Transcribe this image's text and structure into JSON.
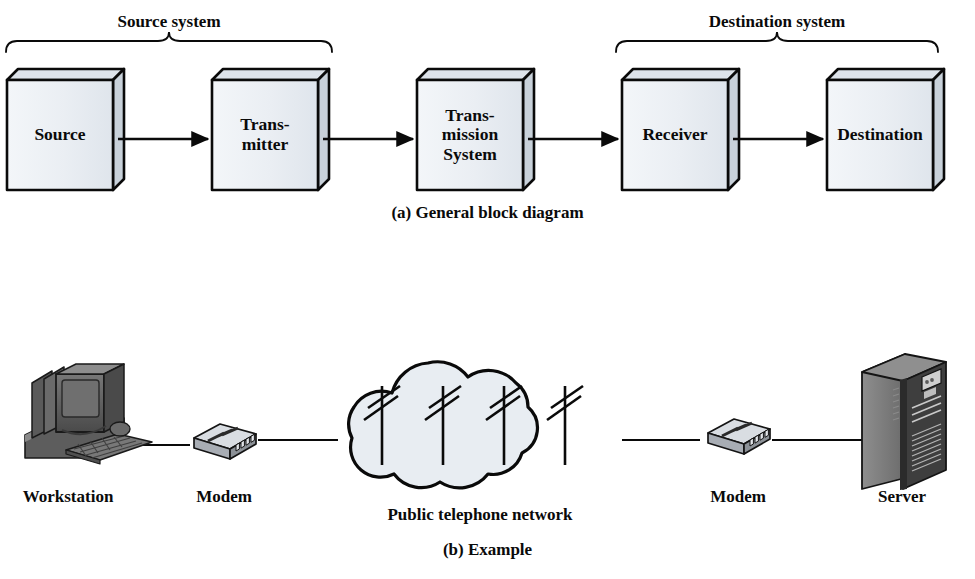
{
  "figure": {
    "panel_a": {
      "caption": "(a) General block diagram",
      "brackets": [
        {
          "label": "Source system",
          "x1": 6,
          "x2": 332,
          "cx": 169
        },
        {
          "label": "Destination system",
          "x1": 616,
          "x2": 938,
          "cx": 777
        }
      ],
      "blocks": [
        {
          "name": "source",
          "lines": [
            "Source"
          ],
          "x": 7,
          "y": 80,
          "w": 106,
          "h": 110
        },
        {
          "name": "transmitter",
          "lines": [
            "Trans-",
            "mitter"
          ],
          "x": 212,
          "y": 80,
          "w": 106,
          "h": 110
        },
        {
          "name": "transmission-system",
          "lines": [
            "Trans-",
            "mission",
            "System"
          ],
          "x": 417,
          "y": 80,
          "w": 106,
          "h": 110
        },
        {
          "name": "receiver",
          "lines": [
            "Receiver"
          ],
          "x": 622,
          "y": 80,
          "w": 106,
          "h": 110
        },
        {
          "name": "destination",
          "lines": [
            "Destination"
          ],
          "x": 827,
          "y": 80,
          "w": 106,
          "h": 110
        }
      ],
      "arrows": [
        {
          "from": "source",
          "to": "transmitter",
          "x1": 118,
          "x2": 208,
          "y": 139
        },
        {
          "from": "transmitter",
          "to": "transmission-system",
          "x1": 323,
          "x2": 413,
          "y": 139
        },
        {
          "from": "transmission-system",
          "to": "receiver",
          "x1": 528,
          "x2": 618,
          "y": 139
        },
        {
          "from": "receiver",
          "to": "destination",
          "x1": 733,
          "x2": 823,
          "y": 139
        }
      ]
    },
    "panel_b": {
      "caption": "(b) Example",
      "nodes": [
        {
          "name": "workstation",
          "icon": "workstation-icon",
          "label": "Workstation",
          "label_cx": 68,
          "label_y": 487
        },
        {
          "name": "modem-left",
          "icon": "modem-icon",
          "label": "Modem",
          "label_cx": 224,
          "label_y": 487
        },
        {
          "name": "public-telephone-network",
          "icon": "cloud-icon",
          "label": "Public telephone network",
          "label_cx": 480,
          "label_y": 505
        },
        {
          "name": "modem-right",
          "icon": "modem-icon",
          "label": "Modem",
          "label_cx": 738,
          "label_y": 487
        },
        {
          "name": "server",
          "icon": "server-icon",
          "label": "Server",
          "label_cx": 902,
          "label_y": 487
        }
      ],
      "links": [
        {
          "from": "workstation",
          "to": "modem-left",
          "x1": 120,
          "x2": 190,
          "y": 445
        },
        {
          "from": "modem-left",
          "to": "public-telephone-network",
          "x1": 258,
          "x2": 338,
          "y": 440
        },
        {
          "from": "public-telephone-network",
          "to": "modem-right",
          "x1": 622,
          "x2": 700,
          "y": 440
        },
        {
          "from": "modem-right",
          "to": "server",
          "x1": 772,
          "x2": 862,
          "y": 440
        }
      ],
      "cloud_poles": 4
    }
  },
  "colors": {
    "block_front": "#eef1f5",
    "block_top": "#dde3ea",
    "block_side": "#c8d1da",
    "outline": "#0a0a0a",
    "cloud_fill": "#e8edf2",
    "device_dark": "#4a4a4a",
    "device_mid": "#6e6e6e",
    "device_light": "#9a9a9a",
    "page_bg": "#ffffff"
  }
}
